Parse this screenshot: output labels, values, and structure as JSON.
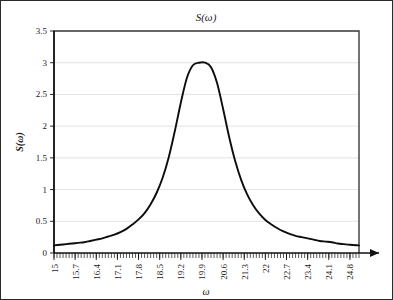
{
  "chart_data": {
    "type": "line",
    "title": "S(ω)",
    "xlabel": "ω",
    "ylabel": "S(ω)",
    "xlim": [
      15,
      25.1
    ],
    "ylim": [
      0,
      3.5
    ],
    "grid": "horizontal",
    "legend": "none",
    "xticklabels": [
      "15",
      "15.7",
      "16.4",
      "17.1",
      "17.8",
      "18.5",
      "19.2",
      "19.9",
      "20.6",
      "21.3",
      "22",
      "22.7",
      "23.4",
      "24.1",
      "24.8"
    ],
    "xtickvalues": [
      15,
      15.7,
      16.4,
      17.1,
      17.8,
      18.5,
      19.2,
      19.9,
      20.6,
      21.3,
      22,
      22.7,
      23.4,
      24.1,
      24.8
    ],
    "yticklabels": [
      "0",
      "0.5",
      "1",
      "1.5",
      "2",
      "2.5",
      "3",
      "3.5"
    ],
    "ytickvalues": [
      0,
      0.5,
      1,
      1.5,
      2,
      2.5,
      3,
      3.5
    ],
    "peak": {
      "x": 20.0,
      "y": 3.0
    },
    "half_width_at_half_max": 0.85,
    "baseline": 0.12,
    "series": [
      {
        "name": "S(ω)",
        "color": "#0d0d0d",
        "x": [
          15.0,
          15.2,
          15.4,
          15.6,
          15.8,
          16.0,
          16.2,
          16.4,
          16.6,
          16.8,
          17.0,
          17.2,
          17.4,
          17.6,
          17.8,
          18.0,
          18.2,
          18.4,
          18.6,
          18.8,
          19.0,
          19.2,
          19.4,
          19.6,
          19.8,
          20.0,
          20.2,
          20.4,
          20.6,
          20.8,
          21.0,
          21.2,
          21.4,
          21.6,
          21.8,
          22.0,
          22.2,
          22.4,
          22.6,
          22.8,
          23.0,
          23.2,
          23.4,
          23.6,
          23.8,
          24.0,
          24.2,
          24.4,
          24.6,
          24.8,
          25.1
        ],
        "y": [
          0.12,
          0.13,
          0.14,
          0.15,
          0.16,
          0.17,
          0.19,
          0.21,
          0.23,
          0.26,
          0.29,
          0.33,
          0.38,
          0.45,
          0.53,
          0.63,
          0.77,
          0.95,
          1.19,
          1.51,
          1.92,
          2.37,
          2.76,
          2.96,
          3.0,
          3.0,
          2.93,
          2.68,
          2.27,
          1.83,
          1.45,
          1.15,
          0.92,
          0.75,
          0.62,
          0.52,
          0.45,
          0.39,
          0.34,
          0.3,
          0.27,
          0.25,
          0.23,
          0.21,
          0.19,
          0.18,
          0.17,
          0.15,
          0.14,
          0.13,
          0.12
        ]
      }
    ]
  }
}
